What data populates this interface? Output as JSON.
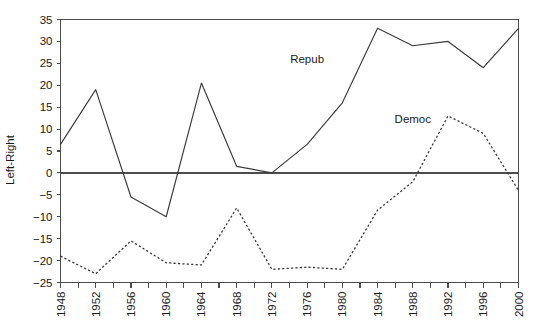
{
  "chart_data": {
    "type": "line",
    "title": "",
    "xlabel": "",
    "ylabel": "Left-Right",
    "xlim": [
      1948,
      2000
    ],
    "ylim": [
      -25,
      35
    ],
    "yticks": [
      -25,
      -20,
      -15,
      -10,
      -5,
      0,
      5,
      10,
      15,
      20,
      25,
      30,
      35
    ],
    "ytick_labels": [
      "−25",
      "−20",
      "−15",
      "−10",
      "−5",
      "0",
      "5",
      "10",
      "15",
      "20",
      "25",
      "30",
      "35"
    ],
    "xticks": [
      1948,
      1950,
      1952,
      1954,
      1956,
      1958,
      1960,
      1962,
      1964,
      1966,
      1968,
      1970,
      1972,
      1974,
      1976,
      1978,
      1980,
      1982,
      1984,
      1986,
      1988,
      1990,
      1992,
      1994,
      1996,
      1998,
      2000
    ],
    "xtick_labels": [
      "1948",
      "",
      "1952",
      "",
      "1956",
      "",
      "1960",
      "",
      "1964",
      "",
      "1968",
      "",
      "1972",
      "",
      "1976",
      "",
      "1980",
      "",
      "1984",
      "",
      "1988",
      "",
      "1992",
      "",
      "1996",
      "",
      "2000"
    ],
    "grid": false,
    "legend_position": "inline-annotations",
    "zero_line": true,
    "x": [
      1948,
      1952,
      1956,
      1960,
      1964,
      1968,
      1972,
      1976,
      1980,
      1984,
      1988,
      1992,
      1996,
      2000
    ],
    "series": [
      {
        "name": "Repub",
        "style": "solid",
        "annotation": "Repub",
        "annotation_x": 1976,
        "annotation_y": 25,
        "values": [
          6.5,
          19,
          -5.5,
          -10,
          20.5,
          1.5,
          0,
          6.5,
          16,
          33,
          29,
          30,
          24,
          33
        ]
      },
      {
        "name": "Democ",
        "style": "dashed",
        "annotation": "Democ",
        "annotation_x": 1988,
        "annotation_y": 11.5,
        "values": [
          -19,
          -23,
          -15.5,
          -20.5,
          -21,
          -8,
          -22,
          -21.5,
          -22,
          -8.5,
          -2,
          13,
          9,
          -4
        ]
      }
    ]
  },
  "axis": {
    "y_title": "Left-Right"
  }
}
